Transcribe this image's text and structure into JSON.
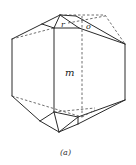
{
  "figure": {
    "caption": "(a)",
    "faces": {
      "m": "m",
      "r": "r",
      "o": "o"
    }
  }
}
